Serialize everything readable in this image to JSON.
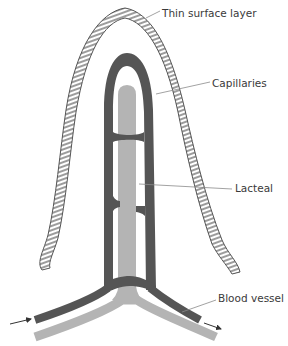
{
  "diagram": {
    "labels": {
      "surface": "Thin surface layer",
      "capillaries": "Capillaries",
      "lacteal": "Lacteal",
      "vessel": "Blood vessel"
    },
    "colors": {
      "background": "#ffffff",
      "capillary": "#555555",
      "lacteal": "#b4b4b4",
      "surface_outline": "#555555",
      "surface_hatch": "#666666",
      "leader_line": "#8a8a8a",
      "text": "#3a3a3a"
    },
    "arrows": {
      "inflow": "left",
      "outflow": "right"
    }
  }
}
